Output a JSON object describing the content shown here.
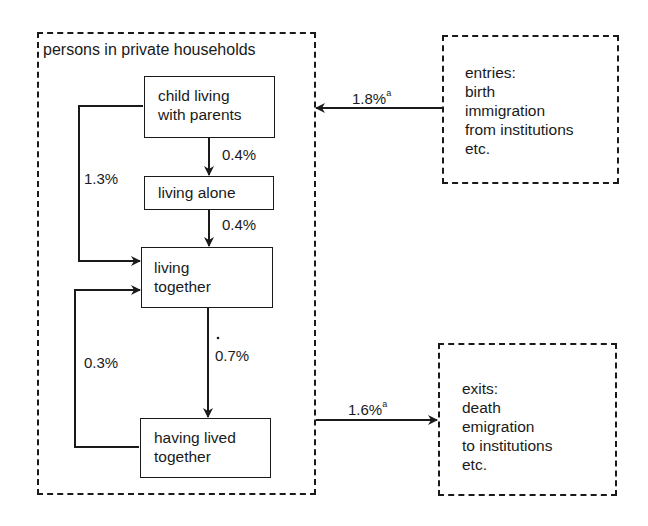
{
  "diagram": {
    "container": {
      "title": "persons in private households"
    },
    "nodes": {
      "child": {
        "line1": "child living",
        "line2": "with parents"
      },
      "alone": {
        "label": "living alone"
      },
      "together": {
        "line1": "living",
        "line2": "together"
      },
      "lived": {
        "line1": "having lived",
        "line2": "together"
      }
    },
    "flows": {
      "child_to_alone": "0.4%",
      "alone_to_together": "0.4%",
      "child_to_together": "1.3%",
      "together_to_lived": "0.7%",
      "lived_to_together": "0.3%",
      "entries_rate": "1.8%",
      "entries_sup": "a",
      "exits_rate": "1.6%",
      "exits_sup": "a"
    },
    "entries": {
      "heading": "entries:",
      "items": [
        "birth",
        "immigration",
        "from institutions",
        "etc."
      ]
    },
    "exits": {
      "heading": "exits:",
      "items": [
        "death",
        "emigration",
        "to institutions",
        "etc."
      ]
    },
    "colors": {
      "ink": "#1a1a1a",
      "background": "#ffffff"
    }
  }
}
